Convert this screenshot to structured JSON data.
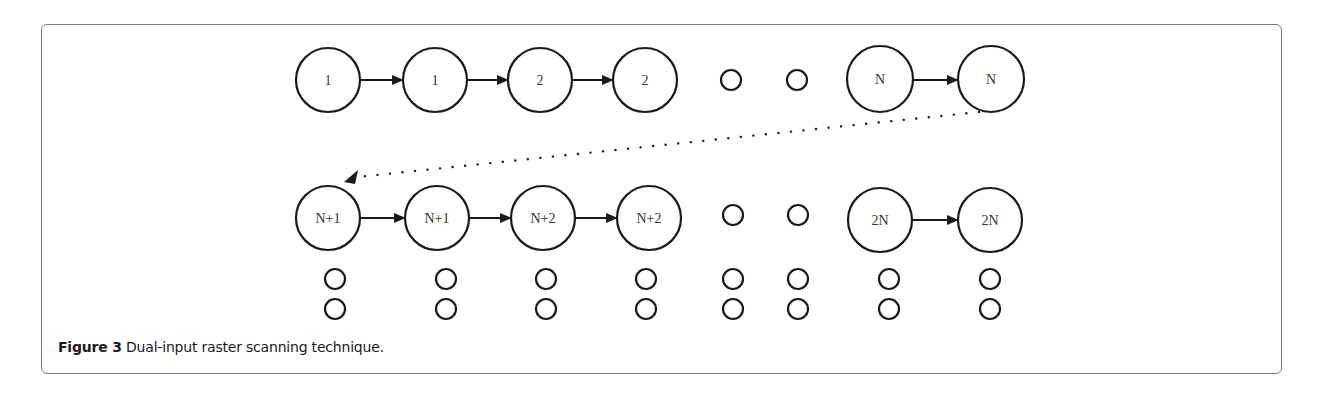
{
  "figure": {
    "label": "Figure 3",
    "caption": "Dual-input raster scanning technique."
  },
  "diagram": {
    "row1": {
      "nodes": [
        {
          "label": "1",
          "cx": 328,
          "cy": 80,
          "r": 32
        },
        {
          "label": "1",
          "cx": 435,
          "cy": 80,
          "r": 32
        },
        {
          "label": "2",
          "cx": 540,
          "cy": 80,
          "r": 32
        },
        {
          "label": "2",
          "cx": 645,
          "cy": 80,
          "r": 32
        },
        {
          "label": "",
          "cx": 731,
          "cy": 80,
          "r": 10
        },
        {
          "label": "",
          "cx": 797,
          "cy": 80,
          "r": 10
        },
        {
          "label": "N",
          "cx": 880,
          "cy": 79,
          "r": 33
        },
        {
          "label": "N",
          "cx": 991,
          "cy": 79,
          "r": 33
        }
      ]
    },
    "row2": {
      "nodes": [
        {
          "label": "N+1",
          "cx": 328,
          "cy": 218,
          "r": 32
        },
        {
          "label": "N+1",
          "cx": 437,
          "cy": 218,
          "r": 32
        },
        {
          "label": "N+2",
          "cx": 543,
          "cy": 218,
          "r": 32
        },
        {
          "label": "N+2",
          "cx": 649,
          "cy": 218,
          "r": 32
        },
        {
          "label": "",
          "cx": 733,
          "cy": 215,
          "r": 10
        },
        {
          "label": "",
          "cx": 798,
          "cy": 215,
          "r": 10
        },
        {
          "label": "2N",
          "cx": 880,
          "cy": 220,
          "r": 32
        },
        {
          "label": "2N",
          "cx": 990,
          "cy": 220,
          "r": 32
        }
      ]
    },
    "continuation_columns_x": [
      335,
      446,
      546,
      646,
      733,
      798,
      889,
      990
    ],
    "continuation_rows_y": [
      279,
      309
    ],
    "stroke_color": "#1a1a1a",
    "text_color": "#333333"
  }
}
